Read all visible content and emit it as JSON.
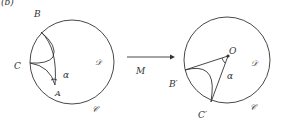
{
  "figure": {
    "panel_label": "(b)",
    "colors": {
      "ink": "#333333",
      "background": "#ffffff"
    }
  },
  "left": {
    "disc": {
      "cx": 72,
      "cy": 62,
      "r": 42
    },
    "labels": {
      "B": "B",
      "C": "C",
      "A": "A",
      "alpha": "α",
      "domain": "𝒟",
      "circle": "𝒞"
    }
  },
  "map": {
    "label": "M"
  },
  "right": {
    "disc": {
      "cx": 227,
      "cy": 60,
      "r": 43
    },
    "labels": {
      "O": "O",
      "B": "B′",
      "C": "C′",
      "alpha": "α",
      "domain": "𝒟",
      "circle": "𝒞"
    }
  }
}
